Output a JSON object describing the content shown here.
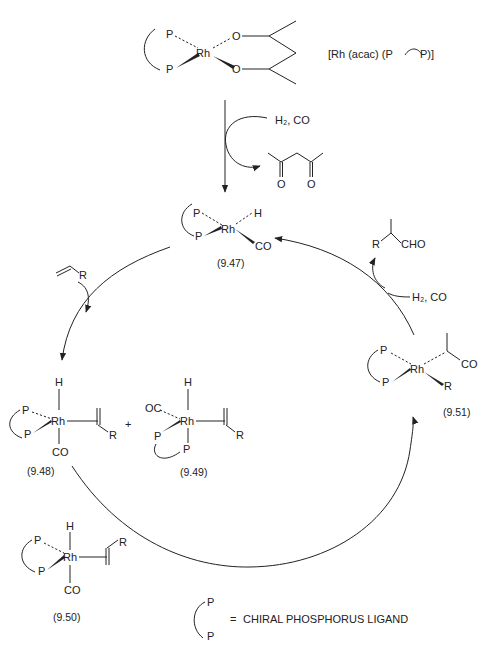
{
  "precatalyst": {
    "formula_label": "[Rh (acac) (P",
    "formula_label_end": "P)]",
    "metal": "Rh",
    "ligand_atoms": [
      "P",
      "P"
    ],
    "acac_atoms": [
      "O",
      "O"
    ]
  },
  "activation": {
    "reagents": "H₂, CO",
    "byproduct": "acetylacetone",
    "byproduct_atoms": [
      "O",
      "O"
    ]
  },
  "species": [
    {
      "id": "9.47",
      "label": "(9.47)",
      "metal": "Rh",
      "atoms": [
        "P",
        "P",
        "H",
        "CO"
      ]
    },
    {
      "id": "9.48",
      "label": "(9.48)",
      "metal": "Rh",
      "atoms": [
        "H",
        "P",
        "P",
        "CO",
        "R"
      ]
    },
    {
      "id": "9.49",
      "label": "(9.49)",
      "metal": "Rh",
      "atoms": [
        "OC",
        "H",
        "P",
        "P",
        "R"
      ]
    },
    {
      "id": "9.50",
      "label": "(9.50)",
      "metal": "Rh",
      "atoms": [
        "H",
        "P",
        "P",
        "CO",
        "R"
      ]
    },
    {
      "id": "9.51",
      "label": "(9.51)",
      "metal": "Rh",
      "atoms": [
        "P",
        "P",
        "CO",
        "R"
      ]
    }
  ],
  "plus_sign": "+",
  "alkene": {
    "substituent": "R"
  },
  "product_step": {
    "reagents": "H₂, CO",
    "product_substituent": "R",
    "product_group": "CHO"
  },
  "legend": {
    "atoms": [
      "P",
      "P"
    ],
    "equals": "=",
    "text": "CHIRAL PHOSPHORUS  LIGAND"
  }
}
